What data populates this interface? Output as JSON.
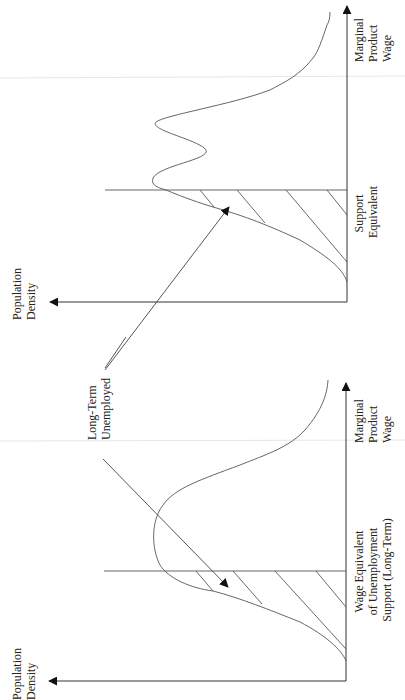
{
  "figure": {
    "orientation": "rotated 90° counter-clockwise",
    "colors": {
      "line": "#444444",
      "background": "#ffffff",
      "text": "#222222"
    },
    "shared_label": {
      "lines": [
        "Long-Term",
        "Unemployed"
      ]
    },
    "panels": [
      {
        "id": "top",
        "y_axis_label": {
          "lines": [
            "Population",
            "Density"
          ]
        },
        "x_axis_label": {
          "lines": [
            "Marginal",
            "Product",
            "Wage"
          ]
        },
        "threshold_label": {
          "lines": [
            "Support",
            "Equivalent"
          ]
        },
        "distribution": "bimodal",
        "shaded_region": "below support equivalent (hatched)"
      },
      {
        "id": "bottom",
        "y_axis_label": {
          "lines": [
            "Population",
            "Density"
          ]
        },
        "x_axis_label": {
          "lines": [
            "Marginal",
            "Product",
            "Wage"
          ]
        },
        "threshold_label": {
          "lines": [
            "Wage Equivalent",
            "of Unemployment",
            "Support (Long-Term)"
          ]
        },
        "distribution": "unimodal",
        "shaded_region": "below wage equivalent of unemployment support (hatched)"
      }
    ]
  }
}
